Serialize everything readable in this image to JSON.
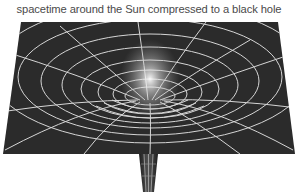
{
  "caption": "spacetime around the Sun compressed to a black hole",
  "figure": {
    "colors": {
      "sheet": "#2b2b2b",
      "grid": "#d6d6d6",
      "glow": "#ffffff",
      "background": "#ffffff"
    }
  }
}
